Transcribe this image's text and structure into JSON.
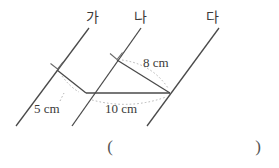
{
  "figure": {
    "line_labels": [
      {
        "name": "line-label-ga",
        "text": "가",
        "x": 92,
        "y": 22
      },
      {
        "name": "line-label-na",
        "text": "나",
        "x": 140,
        "y": 22
      },
      {
        "name": "line-label-da",
        "text": "다",
        "x": 212,
        "y": 22
      }
    ],
    "measurements": [
      {
        "name": "measure-5cm",
        "text": "5 cm",
        "x": 34,
        "y": 113
      },
      {
        "name": "measure-10cm",
        "text": "10 cm",
        "x": 105,
        "y": 113
      },
      {
        "name": "measure-8cm",
        "text": "8 cm",
        "x": 143,
        "y": 67
      }
    ],
    "answer_parens": {
      "open": "(",
      "close": ")",
      "open_x": 110,
      "close_x": 258,
      "y": 152
    },
    "colors": {
      "stroke": "#4a4a4a",
      "guide": "#b5b5b5",
      "text": "#3a3a3a",
      "background": "#ffffff"
    }
  }
}
